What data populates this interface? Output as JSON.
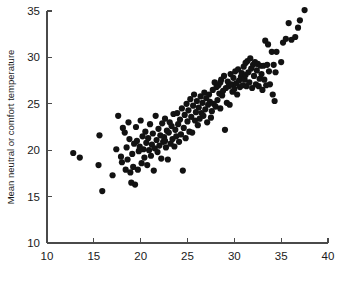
{
  "chart_data": {
    "type": "scatter",
    "title": "",
    "xlabel": "",
    "ylabel": "Mean neutral or comfort temperature",
    "xlim": [
      10,
      40
    ],
    "ylim": [
      10,
      35
    ],
    "xticks": [
      10,
      15,
      20,
      25,
      30,
      35,
      40
    ],
    "yticks": [
      10,
      15,
      20,
      25,
      30,
      35
    ],
    "xtick_labels": [
      "10",
      "15",
      "20",
      "25",
      "30",
      "35",
      "40"
    ],
    "ytick_labels": [
      "10",
      "15",
      "20",
      "25",
      "30",
      "35"
    ],
    "grid": false,
    "legend": null,
    "marker": {
      "shape": "circle",
      "color": "#121212",
      "size": 3.1
    },
    "n_points": 186,
    "points": [
      [
        12.8,
        19.7
      ],
      [
        13.5,
        19.2
      ],
      [
        15.5,
        18.4
      ],
      [
        15.6,
        21.6
      ],
      [
        15.9,
        15.6
      ],
      [
        17.0,
        17.3
      ],
      [
        17.4,
        20.1
      ],
      [
        17.6,
        23.7
      ],
      [
        17.9,
        19.3
      ],
      [
        18.0,
        18.7
      ],
      [
        18.1,
        22.4
      ],
      [
        18.3,
        21.9
      ],
      [
        18.4,
        17.9
      ],
      [
        18.5,
        20.3
      ],
      [
        18.6,
        19.0
      ],
      [
        18.7,
        23.0
      ],
      [
        18.8,
        21.2
      ],
      [
        18.9,
        17.6
      ],
      [
        19.0,
        16.5
      ],
      [
        19.1,
        19.6
      ],
      [
        19.2,
        18.2
      ],
      [
        19.3,
        20.7
      ],
      [
        19.4,
        16.3
      ],
      [
        19.5,
        22.5
      ],
      [
        19.6,
        21.0
      ],
      [
        19.7,
        17.9
      ],
      [
        19.8,
        19.9
      ],
      [
        19.9,
        20.4
      ],
      [
        20.0,
        23.2
      ],
      [
        20.1,
        18.6
      ],
      [
        20.2,
        21.5
      ],
      [
        20.3,
        20.1
      ],
      [
        20.4,
        19.2
      ],
      [
        20.5,
        22.0
      ],
      [
        20.6,
        20.8
      ],
      [
        20.7,
        18.4
      ],
      [
        20.8,
        21.3
      ],
      [
        20.9,
        20.0
      ],
      [
        21.0,
        22.8
      ],
      [
        21.1,
        19.4
      ],
      [
        21.2,
        20.6
      ],
      [
        21.3,
        21.8
      ],
      [
        21.4,
        17.8
      ],
      [
        21.5,
        20.2
      ],
      [
        21.6,
        23.7
      ],
      [
        21.7,
        21.1
      ],
      [
        21.8,
        19.8
      ],
      [
        21.9,
        22.3
      ],
      [
        22.0,
        20.5
      ],
      [
        22.1,
        21.6
      ],
      [
        22.2,
        19.1
      ],
      [
        22.3,
        22.9
      ],
      [
        22.4,
        20.9
      ],
      [
        22.5,
        21.4
      ],
      [
        22.6,
        23.4
      ],
      [
        22.7,
        20.3
      ],
      [
        22.8,
        22.1
      ],
      [
        22.9,
        19.0
      ],
      [
        23.0,
        21.9
      ],
      [
        23.1,
        23.0
      ],
      [
        23.2,
        20.7
      ],
      [
        23.3,
        22.6
      ],
      [
        23.4,
        21.2
      ],
      [
        23.5,
        23.9
      ],
      [
        23.6,
        20.4
      ],
      [
        23.7,
        22.2
      ],
      [
        23.8,
        21.5
      ],
      [
        23.9,
        24.0
      ],
      [
        24.0,
        22.8
      ],
      [
        24.1,
        20.9
      ],
      [
        24.2,
        23.3
      ],
      [
        24.3,
        21.7
      ],
      [
        24.4,
        24.5
      ],
      [
        24.5,
        17.8
      ],
      [
        24.6,
        22.4
      ],
      [
        24.7,
        23.8
      ],
      [
        24.8,
        21.3
      ],
      [
        24.9,
        25.0
      ],
      [
        25.0,
        23.1
      ],
      [
        25.1,
        24.3
      ],
      [
        25.2,
        22.0
      ],
      [
        25.3,
        25.5
      ],
      [
        25.4,
        23.6
      ],
      [
        25.5,
        21.9
      ],
      [
        25.6,
        24.8
      ],
      [
        25.7,
        26.0
      ],
      [
        25.8,
        23.2
      ],
      [
        25.9,
        24.1
      ],
      [
        26.0,
        25.3
      ],
      [
        26.1,
        22.7
      ],
      [
        26.2,
        24.6
      ],
      [
        26.3,
        23.4
      ],
      [
        26.4,
        25.8
      ],
      [
        26.5,
        24.0
      ],
      [
        26.6,
        25.1
      ],
      [
        26.7,
        23.7
      ],
      [
        26.8,
        26.2
      ],
      [
        26.9,
        24.4
      ],
      [
        27.0,
        25.6
      ],
      [
        27.1,
        23.0
      ],
      [
        27.2,
        24.9
      ],
      [
        27.3,
        26.0
      ],
      [
        27.4,
        25.2
      ],
      [
        27.5,
        23.5
      ],
      [
        27.6,
        24.2
      ],
      [
        27.7,
        26.5
      ],
      [
        27.8,
        25.0
      ],
      [
        27.9,
        27.3
      ],
      [
        28.0,
        24.7
      ],
      [
        28.1,
        26.8
      ],
      [
        28.2,
        25.4
      ],
      [
        28.3,
        27.0
      ],
      [
        28.4,
        26.1
      ],
      [
        28.5,
        24.5
      ],
      [
        28.6,
        27.6
      ],
      [
        28.7,
        25.9
      ],
      [
        28.8,
        26.4
      ],
      [
        28.9,
        28.0
      ],
      [
        29.0,
        22.2
      ],
      [
        29.1,
        26.7
      ],
      [
        29.2,
        25.1
      ],
      [
        29.3,
        27.4
      ],
      [
        29.4,
        26.9
      ],
      [
        29.5,
        24.9
      ],
      [
        29.6,
        28.2
      ],
      [
        29.7,
        27.1
      ],
      [
        29.8,
        26.3
      ],
      [
        29.9,
        27.8
      ],
      [
        30.0,
        26.6
      ],
      [
        30.1,
        28.5
      ],
      [
        30.2,
        27.2
      ],
      [
        30.3,
        26.0
      ],
      [
        30.4,
        28.7
      ],
      [
        30.5,
        27.5
      ],
      [
        30.6,
        26.8
      ],
      [
        30.7,
        27.9
      ],
      [
        30.8,
        28.3
      ],
      [
        30.9,
        27.0
      ],
      [
        31.0,
        29.0
      ],
      [
        31.1,
        27.6
      ],
      [
        31.2,
        28.1
      ],
      [
        31.3,
        26.9
      ],
      [
        31.4,
        29.6
      ],
      [
        31.5,
        28.4
      ],
      [
        31.6,
        27.3
      ],
      [
        31.7,
        29.9
      ],
      [
        31.8,
        28.8
      ],
      [
        31.9,
        26.7
      ],
      [
        32.0,
        29.2
      ],
      [
        32.1,
        28.0
      ],
      [
        32.2,
        29.5
      ],
      [
        32.3,
        27.1
      ],
      [
        32.4,
        28.6
      ],
      [
        32.5,
        29.3
      ],
      [
        32.6,
        26.9
      ],
      [
        32.7,
        27.7
      ],
      [
        32.8,
        29.1
      ],
      [
        32.9,
        28.2
      ],
      [
        33.0,
        26.5
      ],
      [
        33.1,
        29.1
      ],
      [
        33.2,
        27.6
      ],
      [
        33.3,
        31.8
      ],
      [
        33.4,
        27.0
      ],
      [
        33.5,
        29.2
      ],
      [
        33.6,
        31.4
      ],
      [
        33.7,
        28.5
      ],
      [
        33.8,
        27.1
      ],
      [
        34.0,
        30.6
      ],
      [
        34.1,
        26.0
      ],
      [
        34.2,
        29.2
      ],
      [
        34.3,
        25.3
      ],
      [
        34.4,
        28.4
      ],
      [
        34.5,
        30.6
      ],
      [
        35.0,
        29.5
      ],
      [
        35.2,
        31.6
      ],
      [
        35.5,
        32.0
      ],
      [
        35.8,
        33.7
      ],
      [
        36.1,
        31.9
      ],
      [
        36.5,
        32.2
      ],
      [
        36.8,
        33.2
      ],
      [
        37.0,
        34.0
      ],
      [
        37.5,
        35.1
      ],
      [
        19.9,
        20.1
      ],
      [
        22.6,
        21.0
      ],
      [
        28.5,
        27.3
      ],
      [
        31.2,
        29.4
      ]
    ]
  },
  "axis": {
    "ylabel": "Mean neutral or comfort temperature"
  }
}
